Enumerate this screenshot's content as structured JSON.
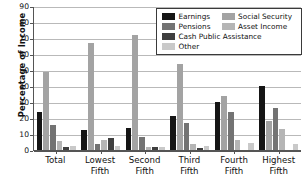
{
  "chart_data": {
    "type": "bar",
    "title": "",
    "xlabel": "",
    "ylabel": "Percentage of Income",
    "ylim": [
      0,
      90
    ],
    "ytick_step": 10,
    "yticks": [
      0,
      10,
      20,
      30,
      40,
      50,
      60,
      70,
      80,
      90
    ],
    "grid": true,
    "legend_position": "upper right",
    "categories": [
      "Total",
      "Lowest Fifth",
      "Second Fifth",
      "Third Fifth",
      "Fourth Fifth",
      "Highest Fifth"
    ],
    "category_lines": [
      [
        "Total",
        ""
      ],
      [
        "Lowest",
        "Fifth"
      ],
      [
        "Second",
        "Fifth"
      ],
      [
        "Third",
        "Fifth"
      ],
      [
        "Fourth",
        "Fifth"
      ],
      [
        "Highest",
        "Fifth"
      ]
    ],
    "series": [
      {
        "name": "Earnings",
        "color": "#151515",
        "values": [
          23.5,
          12.8,
          14.0,
          21.0,
          30.0,
          40.2
        ]
      },
      {
        "name": "Social Security",
        "color": "#a3a3a3",
        "values": [
          49.0,
          67.0,
          72.0,
          54.0,
          34.0,
          18.0
        ]
      },
      {
        "name": "Pensions",
        "color": "#737373",
        "values": [
          15.8,
          3.8,
          8.2,
          17.0,
          24.0,
          26.0
        ]
      },
      {
        "name": "Asset Income",
        "color": "#b5b5b5",
        "values": [
          5.8,
          6.0,
          2.0,
          3.5,
          6.0,
          13.2
        ]
      },
      {
        "name": "Cash Public Assistance",
        "color": "#3f3f3f",
        "values": [
          1.6,
          7.8,
          1.6,
          1.2,
          0.0,
          0.0
        ]
      },
      {
        "name": "Other",
        "color": "#c9c9c9",
        "values": [
          2.6,
          2.6,
          1.6,
          2.6,
          4.5,
          4.0
        ]
      }
    ]
  },
  "legend": {
    "entries": [
      {
        "label": "Earnings",
        "color": "#151515"
      },
      {
        "label": "Social Security",
        "color": "#a3a3a3"
      },
      {
        "label": "Pensions",
        "color": "#737373"
      },
      {
        "label": "Asset Income",
        "color": "#b5b5b5"
      },
      {
        "label": "Cash Public Assistance",
        "color": "#3f3f3f"
      },
      {
        "label": "Other",
        "color": "#c9c9c9"
      }
    ]
  }
}
